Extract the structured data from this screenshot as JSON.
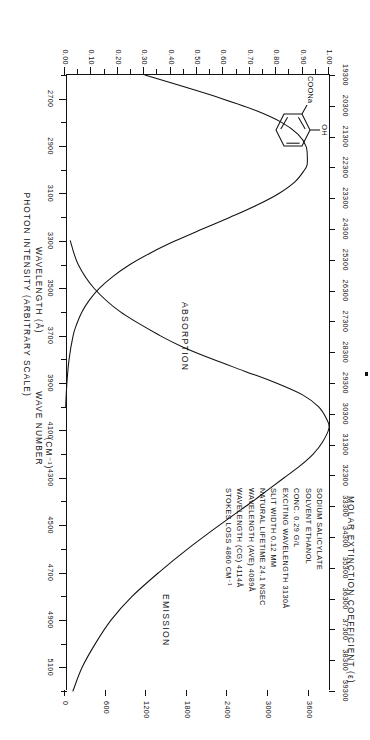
{
  "figure": {
    "sample_name": "SODIUM SALICYLATE",
    "absorption_label": "ABSORPTION",
    "emission_label": "EMISSION"
  },
  "axes": {
    "wavelength": {
      "title": "WAVELENGTH  (Å)",
      "unit": "Å",
      "min": 2600,
      "max": 5200,
      "tick_step": 100,
      "labeled_ticks": [
        2700,
        2900,
        3100,
        3300,
        3500,
        3700,
        3900,
        4100,
        4300,
        4500,
        4700,
        4900,
        5100
      ],
      "labels": [
        "2700",
        "2900",
        "3100",
        "3300",
        "3500",
        "3700",
        "3900",
        "4100",
        "4300",
        "4500",
        "4700",
        "4900",
        "5100"
      ]
    },
    "wavenumber": {
      "title": "WAVE NUMBER",
      "unit": "(CM⁻¹)",
      "min": 19300,
      "max": 39300,
      "tick_step": 1000,
      "labeled_ticks": [
        19300,
        20300,
        21300,
        22300,
        23300,
        24300,
        25300,
        26300,
        27300,
        28300,
        29300,
        30300,
        31300,
        32300,
        33300,
        34300,
        35300,
        36300,
        37300,
        38300,
        39300
      ],
      "labels": [
        "19300",
        "20300",
        "21300",
        "22300",
        "23300",
        "24300",
        "25300",
        "26300",
        "27300",
        "28300",
        "29300",
        "30300",
        "31300",
        "32300",
        "33300",
        "34300",
        "35300",
        "36300",
        "37300",
        "38300",
        "39300"
      ]
    },
    "intensity": {
      "title": "PHOTON INTENSITY (ARBITRARY SCALE)",
      "min": 0.0,
      "max": 1.0,
      "tick_step": 0.05,
      "labeled_ticks": [
        0.0,
        0.1,
        0.2,
        0.3,
        0.4,
        0.5,
        0.6,
        0.7,
        0.8,
        0.9,
        1.0
      ],
      "labels": [
        "0.00",
        "0.10",
        "0.20",
        "0.30",
        "0.40",
        "0.50",
        "0.60",
        "0.70",
        "0.80",
        "0.90",
        "1.00"
      ]
    },
    "extinction": {
      "title": "MOLAR EXTINCTION COEFFICIENT  (ε)",
      "min": 0,
      "max": 3900,
      "tick_step": 300,
      "labeled_ticks": [
        0,
        600,
        1200,
        1800,
        2400,
        3000,
        3600
      ],
      "labels": [
        "0",
        "600",
        "1200",
        "1800",
        "2400",
        "3000",
        "3600"
      ]
    }
  },
  "annotations": [
    "SODIUM SALICYLATE",
    "SOLVENT ETHANOL",
    "CONC.  0.29 G/L",
    "EXCITING WAVELENGTH  3130Å",
    "SLIT WIDTH  0.12 MM",
    "NATURAL LIFETIME  24.1 NSEC",
    "WAVELENGTH (AVE)  4089Å",
    "WAVELENGTH (CG)  4114Å",
    "STOKES LOSS  4860 CM⁻¹"
  ],
  "structure": {
    "name": "sodium-salicylate-structure",
    "substituent_top": "OH",
    "substituent_left": "COONa"
  },
  "colors": {
    "ink": "#111111",
    "background": "#ffffff"
  },
  "chart_data": {
    "type": "line",
    "xlabel": "WAVELENGTH (Å)",
    "ylabel": "PHOTON INTENSITY (ARBITRARY SCALE)",
    "y2label": "MOLAR EXTINCTION COEFFICIENT (ε)",
    "xlim": [
      2600,
      5200
    ],
    "ylim": [
      0.0,
      1.0
    ],
    "y2lim": [
      0,
      3900
    ],
    "grid": false,
    "legend": "inline-annotations",
    "series": [
      {
        "name": "ABSORPTION",
        "yaxis": "extinction",
        "x": [
          2600,
          2650,
          2700,
          2750,
          2800,
          2850,
          2900,
          2950,
          2980,
          3000,
          3050,
          3100,
          3150,
          3200,
          3250,
          3300,
          3350,
          3400,
          3450,
          3500,
          3550,
          3600,
          3650,
          3700,
          3800,
          3900,
          4000
        ],
        "values": [
          1180,
          1760,
          2320,
          2820,
          3200,
          3440,
          3560,
          3580,
          3575,
          3540,
          3400,
          3160,
          2830,
          2440,
          2030,
          1630,
          1270,
          960,
          710,
          510,
          360,
          250,
          175,
          120,
          60,
          28,
          10
        ]
      },
      {
        "name": "EMISSION",
        "yaxis": "intensity",
        "x": [
          3300,
          3400,
          3500,
          3600,
          3700,
          3750,
          3800,
          3850,
          3900,
          3950,
          4000,
          4050,
          4090,
          4150,
          4200,
          4250,
          4300,
          4350,
          4400,
          4500,
          4600,
          4700,
          4800,
          4900,
          5000,
          5100,
          5200
        ],
        "values": [
          0.02,
          0.05,
          0.11,
          0.21,
          0.36,
          0.45,
          0.56,
          0.68,
          0.8,
          0.9,
          0.96,
          0.99,
          1.0,
          0.975,
          0.94,
          0.89,
          0.83,
          0.77,
          0.71,
          0.585,
          0.465,
          0.355,
          0.255,
          0.175,
          0.115,
          0.065,
          0.03
        ]
      }
    ]
  }
}
